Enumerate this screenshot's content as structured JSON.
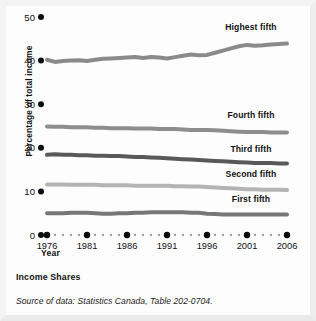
{
  "figure": {
    "caption_title": "Income Shares",
    "caption_source": "Source of data: Statistics Canada, Table 202-0704."
  },
  "chart_data": {
    "type": "line",
    "title": "Income Shares",
    "xlabel": "Year",
    "ylabel": "Percentage of total income",
    "xlim": [
      1976,
      2006
    ],
    "ylim": [
      0,
      50
    ],
    "yticks": [
      0,
      10,
      20,
      30,
      40,
      50
    ],
    "xticks": [
      1976,
      1981,
      1986,
      1991,
      1996,
      2001,
      2006
    ],
    "grid": false,
    "legend_position": "inline-right-of-series",
    "x": [
      1976,
      1977,
      1978,
      1979,
      1980,
      1981,
      1982,
      1983,
      1984,
      1985,
      1986,
      1987,
      1988,
      1989,
      1990,
      1991,
      1992,
      1993,
      1994,
      1995,
      1996,
      1997,
      1998,
      1999,
      2000,
      2001,
      2002,
      2003,
      2004,
      2005,
      2006
    ],
    "series": [
      {
        "name": "Highest fifth",
        "color": "#8a8a8a",
        "values": [
          40.2,
          39.7,
          39.9,
          40.0,
          40.1,
          39.9,
          40.2,
          40.4,
          40.5,
          40.6,
          40.7,
          40.8,
          40.6,
          40.8,
          40.7,
          40.5,
          40.8,
          41.1,
          41.4,
          41.2,
          41.3,
          41.8,
          42.3,
          42.8,
          43.3,
          43.6,
          43.4,
          43.5,
          43.7,
          43.8,
          43.9
        ],
        "label_x": 2001,
        "label_y": 47.0
      },
      {
        "name": "Fourth fifth",
        "color": "#8d8d8d",
        "values": [
          24.9,
          24.8,
          24.8,
          24.7,
          24.7,
          24.7,
          24.6,
          24.6,
          24.5,
          24.5,
          24.5,
          24.4,
          24.4,
          24.4,
          24.3,
          24.3,
          24.3,
          24.2,
          24.1,
          24.1,
          24.1,
          24.0,
          23.9,
          23.8,
          23.7,
          23.6,
          23.6,
          23.6,
          23.5,
          23.5,
          23.5
        ],
        "label_x": 2001,
        "label_y": 26.9
      },
      {
        "name": "Third fifth",
        "color": "#595959",
        "values": [
          18.4,
          18.5,
          18.4,
          18.4,
          18.3,
          18.3,
          18.2,
          18.2,
          18.1,
          18.1,
          18.0,
          17.9,
          17.9,
          17.8,
          17.7,
          17.6,
          17.5,
          17.4,
          17.3,
          17.2,
          17.1,
          17.0,
          16.9,
          16.8,
          16.7,
          16.6,
          16.5,
          16.5,
          16.5,
          16.4,
          16.4
        ],
        "label_x": 2001,
        "label_y": 19.0
      },
      {
        "name": "Second fifth",
        "color": "#b4b4b4",
        "values": [
          11.6,
          11.6,
          11.6,
          11.5,
          11.5,
          11.5,
          11.5,
          11.4,
          11.4,
          11.4,
          11.4,
          11.3,
          11.3,
          11.3,
          11.3,
          11.3,
          11.2,
          11.2,
          11.1,
          11.1,
          11.0,
          10.9,
          10.8,
          10.7,
          10.6,
          10.5,
          10.5,
          10.4,
          10.4,
          10.4,
          10.3
        ],
        "label_x": 2001,
        "label_y": 13.2
      },
      {
        "name": "First fifth",
        "color": "#777777",
        "values": [
          5.0,
          5.0,
          5.0,
          5.1,
          5.1,
          5.1,
          5.0,
          4.9,
          4.9,
          5.0,
          5.0,
          5.1,
          5.1,
          5.2,
          5.2,
          5.2,
          5.2,
          5.2,
          5.1,
          5.1,
          4.9,
          4.8,
          4.7,
          4.7,
          4.7,
          4.7,
          4.7,
          4.7,
          4.7,
          4.7,
          4.7
        ],
        "label_x": 2001,
        "label_y": 7.6
      }
    ]
  }
}
